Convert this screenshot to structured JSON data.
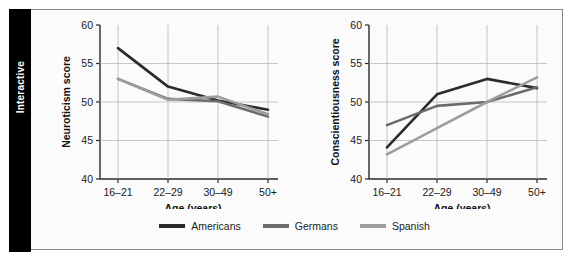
{
  "side_tab": {
    "label": "Interactive"
  },
  "legend": {
    "items": [
      {
        "label": "Americans",
        "color": "#2b2b2b"
      },
      {
        "label": "Germans",
        "color": "#6b6b6b"
      },
      {
        "label": "Spanish",
        "color": "#9d9d9d"
      }
    ]
  },
  "chart_data": [
    {
      "type": "line",
      "title": "",
      "xlabel": "Age (years)",
      "ylabel": "Neuroticism score",
      "categories": [
        "16–21",
        "22–29",
        "30–49",
        "50+"
      ],
      "yticks": [
        40,
        45,
        50,
        55,
        60
      ],
      "ylim": [
        40,
        60
      ],
      "grid": true,
      "legend_position": "bottom-center-shared",
      "series": [
        {
          "name": "Americans",
          "color": "#2b2b2b",
          "values": [
            57.0,
            52.0,
            50.2,
            49.0
          ]
        },
        {
          "name": "Germans",
          "color": "#6b6b6b",
          "values": [
            53.0,
            50.4,
            50.1,
            48.1
          ]
        },
        {
          "name": "Spanish",
          "color": "#9d9d9d",
          "values": [
            53.0,
            50.3,
            50.7,
            48.4
          ]
        }
      ]
    },
    {
      "type": "line",
      "title": "",
      "xlabel": "Age (years)",
      "ylabel": "Conscientiousness score",
      "categories": [
        "16–21",
        "22–29",
        "30–49",
        "50+"
      ],
      "yticks": [
        40,
        45,
        50,
        55,
        60
      ],
      "ylim": [
        40,
        60
      ],
      "grid": true,
      "legend_position": "bottom-center-shared",
      "series": [
        {
          "name": "Americans",
          "color": "#2b2b2b",
          "values": [
            44.1,
            51.0,
            53.0,
            51.8
          ]
        },
        {
          "name": "Germans",
          "color": "#6b6b6b",
          "values": [
            47.0,
            49.5,
            50.0,
            51.9
          ]
        },
        {
          "name": "Spanish",
          "color": "#9d9d9d",
          "values": [
            43.2,
            46.6,
            50.0,
            53.2
          ]
        }
      ]
    }
  ]
}
